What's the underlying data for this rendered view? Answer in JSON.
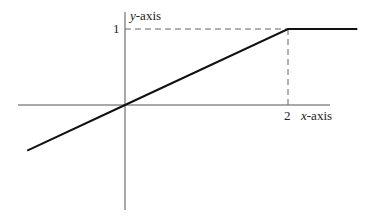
{
  "chart_data": {
    "type": "line",
    "title": "",
    "xlabel": "x-axis",
    "ylabel": "y-axis",
    "x_ticks": [
      {
        "value": 2,
        "label": "2"
      }
    ],
    "y_ticks": [
      {
        "value": 1,
        "label": "1"
      }
    ],
    "series": [
      {
        "name": "piecewise linear function",
        "points": [
          [
            -1.2,
            -0.6
          ],
          [
            0,
            0
          ],
          [
            2,
            1
          ],
          [
            2.85,
            1
          ]
        ]
      }
    ],
    "guides": [
      {
        "type": "dashed-horizontal",
        "from": [
          0,
          1
        ],
        "to": [
          2.85,
          1
        ]
      },
      {
        "type": "dashed-vertical",
        "from": [
          2,
          0
        ],
        "to": [
          2,
          1
        ]
      }
    ],
    "xlim": [
      -1.3,
      2.85
    ],
    "ylim": [
      -1.35,
      1.2
    ],
    "grid": false
  },
  "labels": {
    "x_axis": "x",
    "x_axis_suffix": "-axis",
    "y_axis": "y",
    "y_axis_suffix": "-axis",
    "x_tick": "2",
    "y_tick": "1"
  }
}
